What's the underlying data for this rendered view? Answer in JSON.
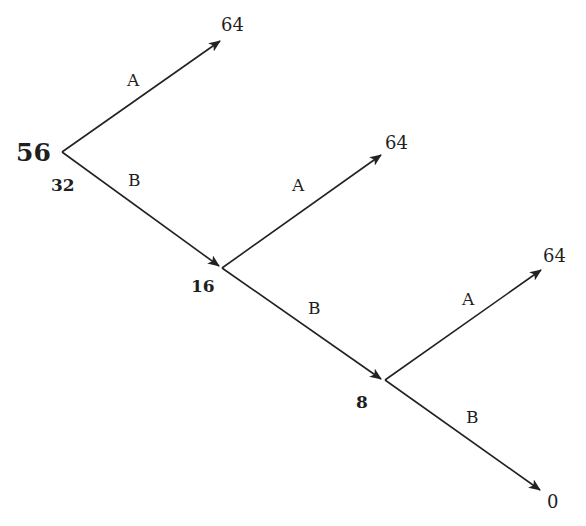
{
  "diagram": {
    "type": "decision-tree",
    "root": {
      "label": "56",
      "sublabel": "32"
    },
    "nodes": [
      {
        "id": "n1",
        "label": "16"
      },
      {
        "id": "n2",
        "label": "8"
      }
    ],
    "edges": [
      {
        "from": "root",
        "to": "leaf1",
        "label": "A"
      },
      {
        "from": "root",
        "to": "n1",
        "label": "B"
      },
      {
        "from": "n1",
        "to": "leaf2",
        "label": "A"
      },
      {
        "from": "n1",
        "to": "n2",
        "label": "B"
      },
      {
        "from": "n2",
        "to": "leaf3",
        "label": "A"
      },
      {
        "from": "n2",
        "to": "leaf4",
        "label": "B"
      }
    ],
    "leaves": [
      {
        "id": "leaf1",
        "label": "64"
      },
      {
        "id": "leaf2",
        "label": "64"
      },
      {
        "id": "leaf3",
        "label": "64"
      },
      {
        "id": "leaf4",
        "label": "0"
      }
    ],
    "colors": {
      "line": "#222222",
      "text": "#1f1f1f",
      "background": "#ffffff"
    }
  }
}
